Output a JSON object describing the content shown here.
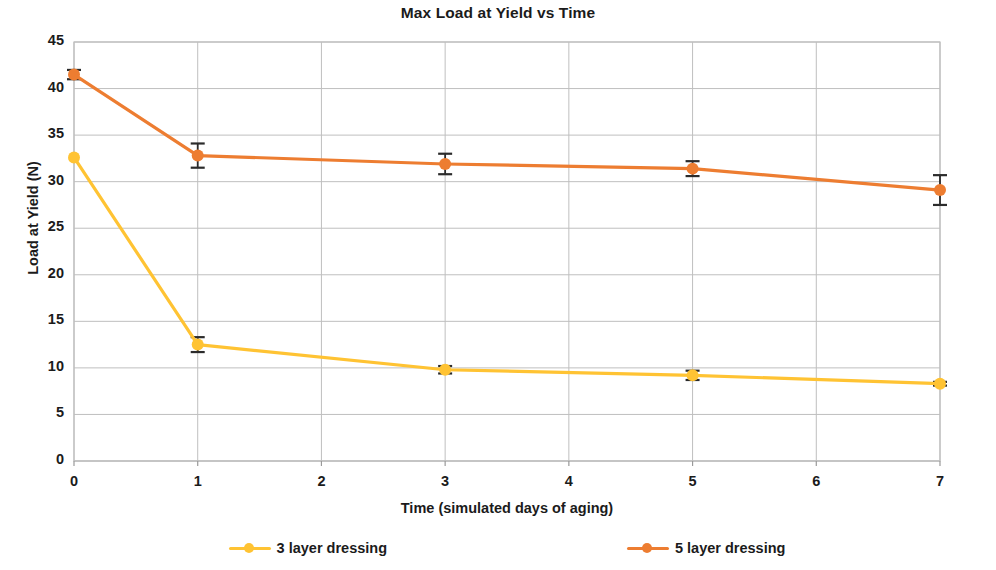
{
  "chart_data": {
    "type": "line",
    "title": "Max Load at Yield vs Time",
    "xlabel": "Time (simulated days of  aging)",
    "ylabel": "Load at Yield (N)",
    "xlim": [
      0,
      7
    ],
    "ylim": [
      0,
      45
    ],
    "x_ticks": [
      "0",
      "1",
      "2",
      "3",
      "4",
      "5",
      "6",
      "7"
    ],
    "y_ticks": [
      "0",
      "5",
      "10",
      "15",
      "20",
      "25",
      "30",
      "35",
      "40",
      "45"
    ],
    "grid": true,
    "legend_position": "bottom",
    "x": [
      0,
      1,
      3,
      5,
      7
    ],
    "series": [
      {
        "name": "3 layer dressing",
        "color": "#FFC333",
        "values": [
          32.6,
          12.5,
          9.8,
          9.2,
          8.3
        ],
        "errors": [
          0.0,
          0.8,
          0.4,
          0.5,
          0.2
        ]
      },
      {
        "name": "5 layer dressing",
        "color": "#ED7D31",
        "values": [
          41.5,
          32.8,
          31.9,
          31.4,
          29.1
        ],
        "errors": [
          0.5,
          1.3,
          1.1,
          0.8,
          1.6
        ]
      }
    ]
  },
  "legend": {
    "items": [
      {
        "label": "3 layer dressing",
        "color": "#FFC333"
      },
      {
        "label": "5 layer dressing",
        "color": "#ED7D31"
      }
    ]
  }
}
